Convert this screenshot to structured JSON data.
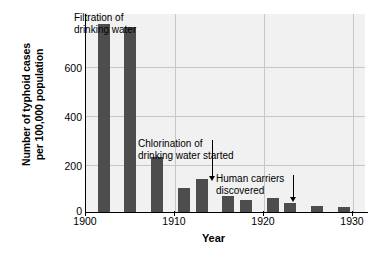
{
  "chart_data": {
    "type": "bar",
    "title": "",
    "xlabel": "Year",
    "ylabel": "Number of typhoid cases per 100,000 population",
    "ylabel_lines": [
      "Number of typhoid cases",
      "per 100,000 population"
    ],
    "xlim": [
      1900,
      1931.5
    ],
    "ylim": [
      0,
      700
    ],
    "grid": "horizontal-and-vertical",
    "legend": "none",
    "bar_color": "#4d4d4d",
    "plot_background": "#f1f1f1",
    "yticks": [
      0,
      200,
      400,
      600
    ],
    "ytick_labels": [
      "0",
      "200",
      "400",
      "600"
    ],
    "xticks": [
      1900,
      1910,
      1920,
      1930
    ],
    "xtick_labels": [
      "1900",
      "1910",
      "1920",
      "1930"
    ],
    "x": [
      1902,
      1905,
      1908,
      1911,
      1913,
      1916,
      1918,
      1921,
      1923,
      1926,
      1929
    ],
    "values": [
      665,
      655,
      195,
      85,
      115,
      55,
      42,
      50,
      32,
      23,
      18
    ],
    "bars": [
      {
        "year": 1902,
        "value": 665
      },
      {
        "year": 1905,
        "value": 655
      },
      {
        "year": 1908,
        "value": 195
      },
      {
        "year": 1911,
        "value": 85
      },
      {
        "year": 1913,
        "value": 115
      },
      {
        "year": 1916,
        "value": 55
      },
      {
        "year": 1918,
        "value": 42
      },
      {
        "year": 1921,
        "value": 50
      },
      {
        "year": 1923,
        "value": 32
      },
      {
        "year": 1926,
        "value": 23
      },
      {
        "year": 1929,
        "value": 18
      }
    ],
    "annotations": [
      {
        "id": "filtration",
        "lines": [
          "Filtration of",
          "drinking water"
        ],
        "points_to_year": 1905,
        "arrow": "down"
      },
      {
        "id": "chlorination",
        "lines": [
          "Chlorination of",
          "drinking water started"
        ],
        "points_to_year": 1913,
        "arrow": "down"
      },
      {
        "id": "human-carriers",
        "lines": [
          "Human carriers",
          "discovered"
        ],
        "points_to_year": 1921,
        "arrow": "down"
      }
    ]
  }
}
